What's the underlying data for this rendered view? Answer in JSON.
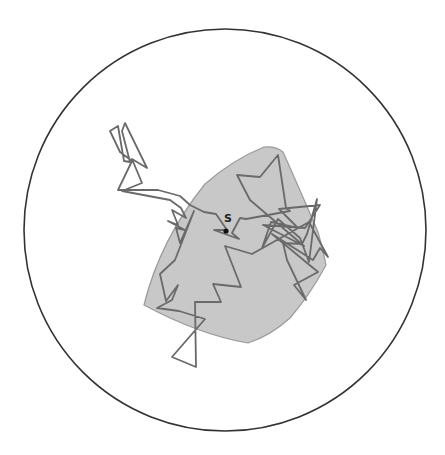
{
  "diagram": {
    "type": "random-walk-in-disk",
    "boundary_circle": {
      "cx": 225,
      "cy": 230,
      "r": 201,
      "stroke": "#333333"
    },
    "region": {
      "fill": "#c8c8c8",
      "stroke": "#9a9a9a",
      "path": "M205,184 Q232,160 264,147 Q276,146 283,152 Q300,190 318,232 Q323,250 326,265 Q310,295 290,318 Q270,336 248,343 Q200,335 144,305 Q160,240 205,184 Z"
    },
    "walk": {
      "stroke": "#6a6a6a",
      "points": "227,230 216,214 204,212 190,205 180,196 158,190 118,190 132,161 120,152 110,131 118,126 124,161 130,162 122,131 125,123 147,168 132,159 142,183 122,191 170,200 181,208 186,218 172,210 178,225 168,221 185,230 176,228 180,243 194,211 175,260 160,274 166,301 178,285 172,300 157,308 179,311 205,319 172,357 196,367 195,302 221,302 213,284 241,287 225,246 252,254 309,222 328,257 320,248 313,260 272,234 318,272 294,285 306,300 287,260 283,243 302,244 307,234 317,199 309,262 300,238 278,219 262,248 271,222 298,228 279,209 320,205 305,228 263,225 304,246 250,200 237,175 260,177 278,155 286,208 290,211 246,219 240,218 232,233 239,239 214,230 227,230",
      "start_point": {
        "x": 226,
        "y": 231
      }
    },
    "start_label": "S"
  }
}
